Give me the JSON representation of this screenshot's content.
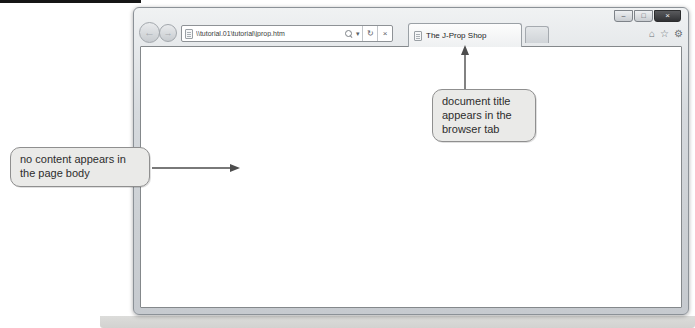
{
  "browser": {
    "window_controls": {
      "minimize_glyph": "–",
      "maximize_glyph": "□",
      "close_glyph": "×"
    },
    "navigation": {
      "back_glyph": "←",
      "forward_glyph": "→"
    },
    "address_bar": {
      "url": "\\\\tutorial.01\\tutorial\\jprop.htm",
      "dropdown_glyph": "▾",
      "refresh_glyph": "↻",
      "stop_glyph": "×"
    },
    "tabs": {
      "active_title": "The J-Prop Shop"
    },
    "toolbar": {
      "home_glyph": "⌂",
      "favorites_glyph": "☆",
      "tools_glyph": "⚙"
    },
    "page_body_content": ""
  },
  "callouts": {
    "page_body": {
      "text": "no content appears in the page body"
    },
    "browser_tab": {
      "text": "document title appears in the browser tab"
    }
  },
  "colors": {
    "frame": "#d3d7db",
    "frame_border": "#8b9197",
    "close_button": "#303134",
    "callout_fill": "#eaeae8",
    "callout_border": "#8f8f8f",
    "arrow": "#4d4d4d"
  }
}
